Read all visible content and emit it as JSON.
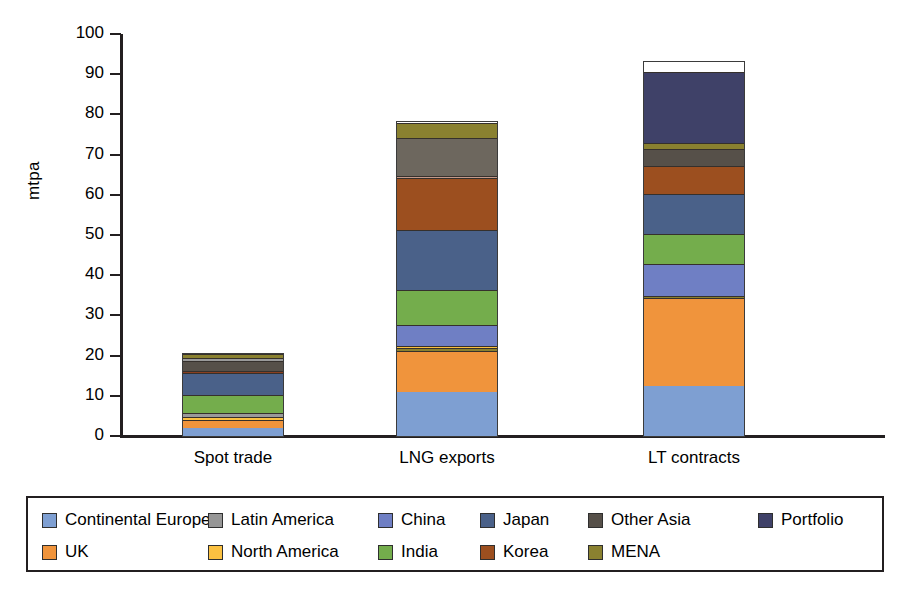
{
  "chart_data": {
    "type": "bar",
    "subtype": "stacked-bar",
    "title": "",
    "xlabel": "",
    "ylabel": "mtpa",
    "ylim": [
      0,
      100
    ],
    "yticks": [
      0,
      10,
      20,
      30,
      40,
      50,
      60,
      70,
      80,
      90,
      100
    ],
    "grid": false,
    "legend_position": "bottom",
    "categories": [
      "Spot trade",
      "LNG exports",
      "LT contracts"
    ],
    "totals": [
      20.5,
      78.0,
      93.0
    ],
    "series": [
      {
        "name": "Continental Europe",
        "color": "#7e9fd2",
        "values": [
          2.0,
          11.0,
          12.5
        ]
      },
      {
        "name": "UK",
        "color": "#f0943c",
        "values": [
          2.0,
          10.0,
          22.0
        ]
      },
      {
        "name": "Latin America",
        "color": "#969696",
        "values": [
          0.7,
          0.5,
          0.0
        ]
      },
      {
        "name": "North America",
        "color": "#fbc141",
        "values": [
          0.8,
          0.5,
          0.0
        ]
      },
      {
        "name": "China",
        "color": "#6f7fc4",
        "values": [
          0.0,
          5.0,
          8.0
        ]
      },
      {
        "name": "India",
        "color": "#74ad4c",
        "values": [
          4.5,
          9.0,
          7.5
        ]
      },
      {
        "name": "Japan",
        "color": "#4a6punk",
        "values": [
          5.5,
          15.0,
          10.0
        ]
      },
      {
        "name": "Korea",
        "color": "#9c4f1f",
        "values": [
          0.5,
          13.0,
          7.0
        ]
      },
      {
        "name": "Other Asia",
        "color": "#565049",
        "values": [
          2.5,
          9.5,
          4.0
        ]
      },
      {
        "name": "MENA",
        "color": "#8a8130",
        "values": [
          1.0,
          4.0,
          2.0
        ]
      },
      {
        "name": "Portfolio",
        "color": "#3f4168",
        "values": [
          0.0,
          0.0,
          17.5
        ]
      }
    ],
    "stack_order": {
      "Spot trade": [
        "Continental Europe",
        "UK",
        "North America",
        "Latin America",
        "India",
        "Japan",
        "Korea",
        "Other Asia",
        "Latin America",
        "MENA"
      ],
      "LNG exports": [
        "Continental Europe",
        "UK",
        "MENA",
        "North America",
        "China",
        "India",
        "Japan",
        "Korea",
        "Latin America",
        "Other Asia",
        "MENA"
      ],
      "LT contracts": [
        "Continental Europe",
        "UK",
        "MENA",
        "China",
        "India",
        "Japan",
        "Korea",
        "Other Asia",
        "MENA",
        "Portfolio"
      ]
    },
    "stacks": [
      {
        "category": "Spot trade",
        "segments": [
          {
            "name": "Continental Europe",
            "value": 2.0,
            "color": "#7e9fd2"
          },
          {
            "name": "UK",
            "value": 2.0,
            "color": "#f0943c"
          },
          {
            "name": "North America",
            "value": 0.8,
            "color": "#fbc141"
          },
          {
            "name": "Latin America",
            "value": 0.9,
            "color": "#9a9a9a"
          },
          {
            "name": "India",
            "value": 4.6,
            "color": "#74ad4c"
          },
          {
            "name": "Japan",
            "value": 5.4,
            "color": "#4a6189"
          },
          {
            "name": "Korea",
            "value": 0.6,
            "color": "#8a3f20"
          },
          {
            "name": "Other Asia",
            "value": 2.4,
            "color": "#565049"
          },
          {
            "name": "Latin America",
            "value": 0.8,
            "color": "#9a9a9a"
          },
          {
            "name": "MENA",
            "value": 1.0,
            "color": "#8a8130"
          }
        ]
      },
      {
        "category": "LNG exports",
        "segments": [
          {
            "name": "Continental Europe",
            "value": 11.0,
            "color": "#7e9fd2"
          },
          {
            "name": "UK",
            "value": 10.2,
            "color": "#f0943c"
          },
          {
            "name": "MENA",
            "value": 0.8,
            "color": "#8a8130"
          },
          {
            "name": "North America",
            "value": 0.5,
            "color": "#fbc141"
          },
          {
            "name": "China",
            "value": 5.0,
            "color": "#6f7fc4"
          },
          {
            "name": "India",
            "value": 8.8,
            "color": "#74ad4c"
          },
          {
            "name": "Japan",
            "value": 15.0,
            "color": "#4a6189"
          },
          {
            "name": "Korea",
            "value": 13.0,
            "color": "#9c4f1f"
          },
          {
            "name": "Latin America",
            "value": 0.5,
            "color": "#c49a8a"
          },
          {
            "name": "Other Asia",
            "value": 9.4,
            "color": "#6d675e"
          },
          {
            "name": "MENA",
            "value": 3.8,
            "color": "#8a8130"
          }
        ]
      },
      {
        "category": "LT contracts",
        "segments": [
          {
            "name": "Continental Europe",
            "value": 12.5,
            "color": "#7e9fd2"
          },
          {
            "name": "UK",
            "value": 21.8,
            "color": "#f0943c"
          },
          {
            "name": "MENA",
            "value": 0.5,
            "color": "#8a8130"
          },
          {
            "name": "China",
            "value": 8.0,
            "color": "#6f7fc4"
          },
          {
            "name": "India",
            "value": 7.5,
            "color": "#74ad4c"
          },
          {
            "name": "Japan",
            "value": 10.0,
            "color": "#4a6189"
          },
          {
            "name": "Korea",
            "value": 7.0,
            "color": "#9c4f1f"
          },
          {
            "name": "Other Asia",
            "value": 4.2,
            "color": "#565049"
          },
          {
            "name": "MENA",
            "value": 1.5,
            "color": "#8a8130"
          },
          {
            "name": "Portfolio",
            "value": 17.5,
            "color": "#3f4168"
          }
        ]
      }
    ]
  },
  "legend": {
    "row1": [
      {
        "label": "Continental Europe",
        "color": "#7e9fd2"
      },
      {
        "label": "Latin America",
        "color": "#969696"
      },
      {
        "label": "China",
        "color": "#6f7fc4"
      },
      {
        "label": "Japan",
        "color": "#4a6189"
      },
      {
        "label": "Other Asia",
        "color": "#565049"
      },
      {
        "label": "Portfolio",
        "color": "#3f4168"
      }
    ],
    "row2": [
      {
        "label": "UK",
        "color": "#f0943c"
      },
      {
        "label": "North America",
        "color": "#fbc141"
      },
      {
        "label": "India",
        "color": "#74ad4c"
      },
      {
        "label": "Korea",
        "color": "#9c4f1f"
      },
      {
        "label": "MENA",
        "color": "#8a8130"
      }
    ]
  }
}
